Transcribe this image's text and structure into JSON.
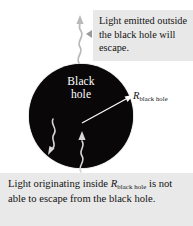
{
  "figure": {
    "background_color": "#ffffff"
  },
  "black_hole": {
    "label_line1": "Black",
    "label_line2": "hole",
    "fill_color": "#0a0708",
    "label_color": "#ffffff",
    "center_x": 81,
    "center_y": 116,
    "radius": 52
  },
  "radius_annotation": {
    "symbol": "R",
    "subscript": "black hole",
    "arrow_color": "#ffffff",
    "text_color": "#111111"
  },
  "callout_top": {
    "text": "Light emitted outside the black hole will escape.",
    "background_color": "#e8e8e8",
    "text_color": "#141414",
    "pointer_color": "#9a9a9a"
  },
  "caption_bottom": {
    "text_before": "Light originating inside",
    "symbol": "R",
    "subscript": "black hole",
    "text_after": "is not able to escape from the black hole.",
    "background_color": "#e9e9e9",
    "text_color": "#121212"
  },
  "light_rays": [
    {
      "name": "escaping-ray",
      "description": "wavy photon arrow outside the black hole pointing up",
      "color": "#b8b8b8",
      "direction": "up",
      "location": "outside"
    },
    {
      "name": "trapped-ray-downleft",
      "description": "wavy photon arrow inside the black hole curving down-left",
      "color": "#d8d8d8",
      "direction": "down-left",
      "location": "inside"
    },
    {
      "name": "trapped-ray-up",
      "description": "wavy photon arrow inside the black hole pointing up toward centre",
      "color": "#d8d8d8",
      "direction": "up",
      "location": "inside"
    }
  ]
}
